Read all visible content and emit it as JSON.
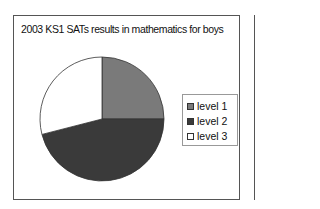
{
  "chart_data": {
    "type": "pie",
    "title": "2003 KS1 SATs results in mathematics for boys",
    "categories": [
      "level 1",
      "level 2",
      "level 3"
    ],
    "values": [
      25,
      46,
      29
    ],
    "unit": "percent (estimated from slice angles)",
    "colors": [
      "#7a7a7a",
      "#3a3a3a",
      "#ffffff"
    ],
    "start_angle": "12 o'clock",
    "direction": "clockwise",
    "legend_position": "right"
  },
  "legend": {
    "items": [
      {
        "label": "level 1",
        "color": "#7a7a7a"
      },
      {
        "label": "level 2",
        "color": "#3a3a3a"
      },
      {
        "label": "level 3",
        "color": "#ffffff"
      }
    ]
  }
}
